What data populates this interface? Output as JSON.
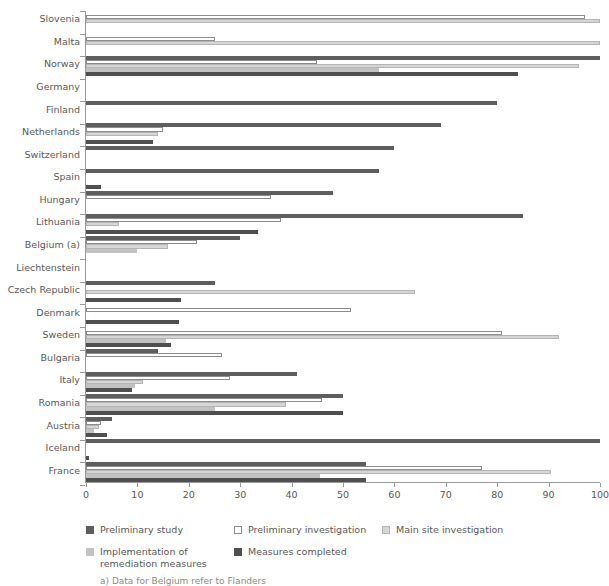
{
  "chart_data": {
    "type": "bar",
    "orientation": "horizontal",
    "title": "",
    "xlabel": "",
    "ylabel": "",
    "xlim": [
      0,
      100
    ],
    "xticks": [
      0,
      10,
      20,
      30,
      40,
      50,
      60,
      70,
      80,
      90,
      100
    ],
    "grid": false,
    "legend_position": "bottom-left",
    "categories": [
      "Slovenia",
      "Malta",
      "Norway",
      "Germany",
      "Finland",
      "Netherlands",
      "Switzerland",
      "Spain",
      "Hungary",
      "Lithuania",
      "Belgium (a)",
      "Liechtenstein",
      "Czech Republic",
      "Denmark",
      "Sweden",
      "Bulgaria",
      "Italy",
      "Romania",
      "Austria",
      "Iceland",
      "France"
    ],
    "series": [
      {
        "name": "Preliminary study",
        "color": "#5e5e5e",
        "values": [
          null,
          null,
          100,
          null,
          80,
          69,
          60,
          57,
          48,
          85,
          30,
          null,
          25,
          null,
          null,
          14,
          41,
          50,
          5,
          100,
          54.5
        ]
      },
      {
        "name": "Preliminary investigation",
        "color": "#ffffff",
        "values": [
          97,
          25,
          45,
          null,
          null,
          15,
          null,
          null,
          36,
          38,
          21.5,
          null,
          null,
          51.5,
          81,
          26.5,
          28,
          46,
          3,
          null,
          77
        ]
      },
      {
        "name": "Main site investigation",
        "color": "#d6d6d6",
        "values": [
          100,
          100,
          96,
          null,
          null,
          14,
          null,
          null,
          null,
          6.5,
          16,
          null,
          64,
          null,
          92,
          null,
          11,
          39,
          2.5,
          null,
          90.5
        ]
      },
      {
        "name": "Implementation of remediation measures",
        "color": "#c2c2c2",
        "values": [
          null,
          null,
          57,
          null,
          null,
          null,
          null,
          null,
          null,
          null,
          10,
          null,
          null,
          null,
          15.5,
          null,
          9.5,
          25,
          1.5,
          null,
          45.5
        ]
      },
      {
        "name": "Measures completed",
        "color": "#4f4f4f",
        "values": [
          null,
          null,
          84,
          null,
          null,
          13,
          null,
          3,
          null,
          33.5,
          null,
          null,
          18.5,
          18,
          16.5,
          null,
          9,
          50,
          4,
          0.5,
          54.5
        ]
      }
    ]
  },
  "legend": {
    "items": [
      {
        "label": "Preliminary study",
        "swatch": "s0"
      },
      {
        "label": "Preliminary investigation",
        "swatch": "s1"
      },
      {
        "label": "Main site investigation",
        "swatch": "s2"
      },
      {
        "label": "Implementation of\nremediation measures",
        "swatch": "s3"
      },
      {
        "label": "Measures completed",
        "swatch": "s4"
      }
    ]
  },
  "footnote": "a)  Data for Belgium refer to Flanders"
}
